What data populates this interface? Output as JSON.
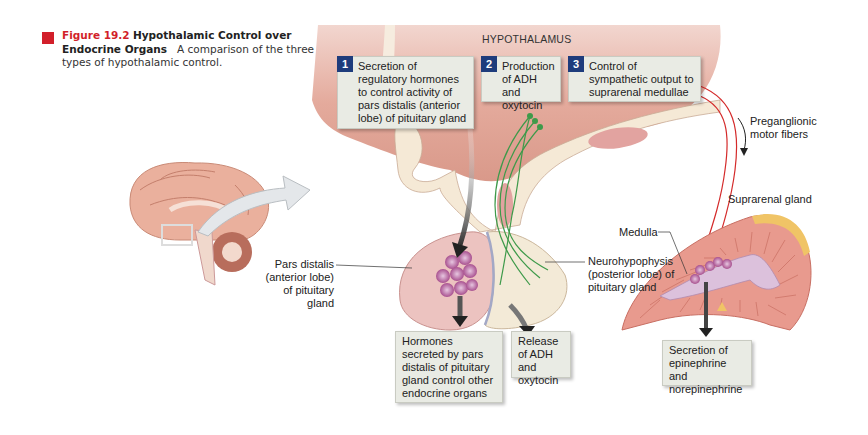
{
  "caption": {
    "figure_number": "Figure 19.2",
    "title": "Hypothalamic Control over Endocrine Organs",
    "description": "A comparison of the three types of hypothalamic control.",
    "accent_color": "#d21f2a"
  },
  "region_label": "HYPOTHALAMUS",
  "steps": [
    {
      "number": "1",
      "text": "Secretion of regulatory hormones to control activity of pars distalis (anterior lobe) of pituitary gland"
    },
    {
      "number": "2",
      "text": "Production of ADH and oxytocin"
    },
    {
      "number": "3",
      "text": "Control of sympathetic output to suprarenal medullae"
    }
  ],
  "labels": {
    "preganglionic": "Preganglionic motor fibers",
    "suprarenal_gland": "Suprarenal gland",
    "medulla": "Medulla",
    "pars_distalis": "Pars distalis (anterior lobe) of pituitary gland",
    "neurohypophysis": "Neurohypophysis (posterior lobe) of pituitary gland"
  },
  "outcomes": [
    {
      "text": "Hormones secreted by pars distalis of pituitary gland control other endocrine organs"
    },
    {
      "text": "Release of ADH and oxytocin"
    },
    {
      "text": "Secretion of epinephrine and norepinephrine"
    }
  ],
  "colors": {
    "step_badge": "#1e3c7c",
    "box_fill": "#e9ebe4",
    "tissue": "#e8a99a",
    "nerve": "#d42a2a",
    "neuron": "#3e9a4a"
  }
}
